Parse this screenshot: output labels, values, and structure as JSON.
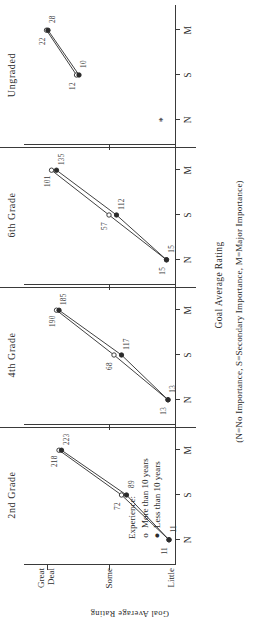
{
  "chart_data": {
    "type": "line",
    "title": "",
    "xlabel": "Goal Average Rating",
    "ylabel": "Goal Average Rating",
    "note": "(N=No Importance, S=Secondary Importance, M=Major Importance)",
    "y_tick_labels": [
      "Great Deal",
      "Some",
      "Little"
    ],
    "x_tick_labels": [
      "N",
      "S",
      "M"
    ],
    "categories": [
      "N",
      "S",
      "M"
    ],
    "ylim": [
      0,
      3
    ],
    "grid": false,
    "legend": {
      "title": "Experience:",
      "entries": [
        {
          "marker": "o",
          "label": "More than 10 years"
        },
        {
          "marker": "●",
          "label": "Less than 10 years"
        }
      ]
    },
    "panels": [
      {
        "name": "2nd Grade",
        "series": [
          {
            "name": "More than 10 years",
            "marker": "o",
            "x": [
              "N",
              "S",
              "M"
            ],
            "y": [
              0.1,
              1.05,
              2.3
            ],
            "point_labels": [
              "11",
              "72",
              "218"
            ]
          },
          {
            "name": "Less than 10 years",
            "marker": "●",
            "x": [
              "N",
              "S",
              "M"
            ],
            "y": [
              0.1,
              0.95,
              2.25
            ],
            "point_labels": [
              "11",
              "89",
              "223"
            ]
          }
        ]
      },
      {
        "name": "4th Grade",
        "series": [
          {
            "name": "More than 10 years",
            "marker": "o",
            "x": [
              "N",
              "S",
              "M"
            ],
            "y": [
              0.12,
              1.2,
              2.35
            ],
            "point_labels": [
              "13",
              "68",
              "190"
            ]
          },
          {
            "name": "Less than 10 years",
            "marker": "●",
            "x": [
              "N",
              "S",
              "M"
            ],
            "y": [
              0.12,
              1.05,
              2.3
            ],
            "point_labels": [
              "13",
              "117",
              "185"
            ]
          }
        ]
      },
      {
        "name": "6th Grade",
        "series": [
          {
            "name": "More than 10 years",
            "marker": "o",
            "x": [
              "N",
              "S",
              "M"
            ],
            "y": [
              0.15,
              1.3,
              2.45
            ],
            "point_labels": [
              "15",
              "57",
              "101"
            ]
          },
          {
            "name": "Less than 10 years",
            "marker": "●",
            "x": [
              "N",
              "S",
              "M"
            ],
            "y": [
              0.15,
              1.15,
              2.35
            ],
            "point_labels": [
              "15",
              "112",
              "135"
            ]
          }
        ]
      },
      {
        "name": "Ungraded",
        "missing_marker": "*",
        "series": [
          {
            "name": "More than 10 years",
            "marker": "o",
            "x": [
              "S",
              "M"
            ],
            "y": [
              1.95,
              2.55
            ],
            "point_labels": [
              "12",
              "22"
            ]
          },
          {
            "name": "Less than 10 years",
            "marker": "●",
            "x": [
              "S",
              "M"
            ],
            "y": [
              1.9,
              2.52
            ],
            "point_labels": [
              "10",
              "28"
            ]
          }
        ]
      }
    ]
  }
}
